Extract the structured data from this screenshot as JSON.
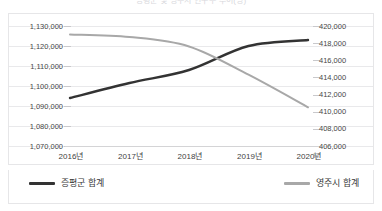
{
  "chart_data": {
    "type": "line",
    "title": "증평군 및 영주시 인구수 추이(명)",
    "xlabel": "",
    "ylabel": "",
    "grid": true,
    "legend_position": "bottom",
    "categories": [
      "2016년",
      "2017년",
      "2018년",
      "2019년",
      "2020년"
    ],
    "axes": {
      "left": {
        "name": "증평군 합계",
        "min": 1070000,
        "max": 1130000,
        "step": 10000,
        "ticks": [
          "1,130,000",
          "1,120,000",
          "1,110,000",
          "1,100,000",
          "1,090,000",
          "1,080,000",
          "1,070,000"
        ]
      },
      "right": {
        "name": "영주시 합계",
        "min": 406000,
        "max": 420000,
        "step": 2000,
        "ticks": [
          "420,000",
          "418,000",
          "416,000",
          "414,000",
          "412,000",
          "410,000",
          "408,000",
          "406,000"
        ]
      }
    },
    "series": [
      {
        "name": "증평군 합계",
        "axis": "left",
        "color": "#333333",
        "values": [
          1093500,
          1101000,
          1107500,
          1119500,
          1122500
        ]
      },
      {
        "name": "영주시 합계",
        "axis": "right",
        "color": "#a8a8a8",
        "values": [
          418900,
          418600,
          417500,
          414200,
          410400
        ]
      }
    ]
  },
  "legend": {
    "items": [
      {
        "label": "증평군 합계",
        "color": "#333333"
      },
      {
        "label": "영주시 합계",
        "color": "#a8a8a8"
      }
    ]
  },
  "corner": {
    "glyph": "⊞"
  }
}
